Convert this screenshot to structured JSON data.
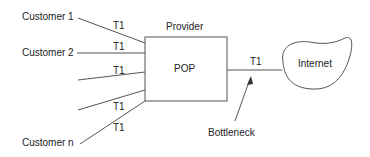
{
  "customers": [
    {
      "label": "Customer 1",
      "link": "T1"
    },
    {
      "label": "Customer 2",
      "link": "T1"
    },
    {
      "label": "",
      "link": "T1"
    },
    {
      "label": "",
      "link": "T1"
    },
    {
      "label": "Customer n",
      "link": "T1"
    }
  ],
  "provider": {
    "title": "Provider",
    "box_label": "POP"
  },
  "uplink": {
    "label": "T1"
  },
  "internet": {
    "label": "Internet"
  },
  "annotation": {
    "label": "Bottleneck"
  }
}
